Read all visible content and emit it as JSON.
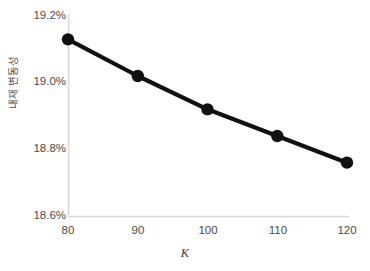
{
  "chart_data": {
    "type": "line",
    "title": "",
    "xlabel": "K",
    "ylabel": "내재 변동성",
    "x": [
      80,
      90,
      100,
      110,
      120
    ],
    "values": [
      19.13,
      19.02,
      18.92,
      18.84,
      18.76
    ],
    "series": [
      {
        "name": "내재 변동성",
        "values": [
          19.13,
          19.02,
          18.92,
          18.84,
          18.76
        ]
      }
    ],
    "xtick_labels": [
      "80",
      "90",
      "100",
      "110",
      "120"
    ],
    "ytick_labels": [
      "19.2%",
      "19.0%",
      "18.8%",
      "18.6%"
    ],
    "ytick_values": [
      19.2,
      19.0,
      18.8,
      18.6
    ],
    "xlim": [
      80,
      120
    ],
    "ylim": [
      18.6,
      19.2
    ],
    "grid": false,
    "legend": false,
    "legend_position": "none",
    "line_color": "#111111",
    "marker_color": "#111111",
    "axis_color": "#d9d9d9",
    "text_color": "#4a4a4a",
    "background_color": "#ffffff"
  }
}
